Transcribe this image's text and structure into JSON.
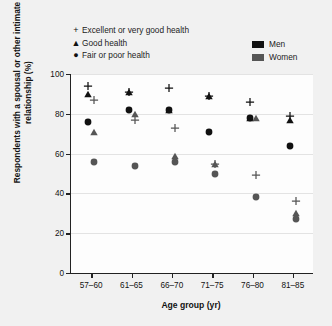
{
  "axes": {
    "ylabel": "Respondents with a spousal or other intimate relationship (%)",
    "xlabel": "Age group (yr)",
    "yticks": [
      "0",
      "20",
      "40",
      "60",
      "80",
      "100"
    ],
    "xticks": [
      "57–60",
      "61–65",
      "66–70",
      "71–75",
      "76–80",
      "81–85"
    ]
  },
  "legend": {
    "markers": [
      {
        "glyph": "+",
        "label": "Excellent or very good health"
      },
      {
        "glyph": "▲",
        "label": "Good health"
      },
      {
        "glyph": "●",
        "label": "Fair or poor health"
      }
    ],
    "series": [
      {
        "label": "Men",
        "color": "#111111"
      },
      {
        "label": "Women",
        "color": "#555555"
      }
    ]
  },
  "chart_data": {
    "type": "scatter",
    "title": "",
    "xlabel": "Age group (yr)",
    "ylabel": "Respondents with a spousal or other intimate relationship (%)",
    "ylim": [
      0,
      100
    ],
    "ytick_values": [
      0,
      20,
      40,
      60,
      80,
      100
    ],
    "grid": true,
    "legend_position": "top",
    "categories": [
      "57–60",
      "61–65",
      "66–70",
      "71–75",
      "76–80",
      "81–85"
    ],
    "marker_meaning": {
      "plus": "Excellent or very good health",
      "triangle": "Good health",
      "circle": "Fair or poor health"
    },
    "color_meaning": {
      "#111111": "Men",
      "#555555": "Women"
    },
    "series": [
      {
        "name": "Men – Excellent or very good health",
        "marker": "plus",
        "color": "#111111",
        "values": [
          94,
          91,
          93,
          89,
          86,
          79
        ]
      },
      {
        "name": "Men – Good health",
        "marker": "triangle",
        "color": "#111111",
        "values": [
          90,
          91,
          82,
          89,
          78,
          77
        ]
      },
      {
        "name": "Men – Fair or poor health",
        "marker": "circle",
        "color": "#111111",
        "values": [
          76,
          82,
          82,
          71,
          78,
          64
        ]
      },
      {
        "name": "Women – Excellent or very good health",
        "marker": "plus",
        "color": "#555555",
        "values": [
          87,
          77,
          73,
          55,
          49,
          36
        ]
      },
      {
        "name": "Women – Good health",
        "marker": "triangle",
        "color": "#555555",
        "values": [
          71,
          80,
          59,
          55,
          78,
          30
        ]
      },
      {
        "name": "Women – Fair or poor health",
        "marker": "circle",
        "color": "#555555",
        "values": [
          56,
          54,
          56,
          50,
          38,
          27
        ]
      }
    ],
    "points": [
      {
        "group": "57–60",
        "series": "Men",
        "health": "Excellent or very good health",
        "marker": "plus",
        "value": 94
      },
      {
        "group": "57–60",
        "series": "Men",
        "health": "Good health",
        "marker": "triangle",
        "value": 90
      },
      {
        "group": "57–60",
        "series": "Men",
        "health": "Fair or poor health",
        "marker": "circle",
        "value": 76
      },
      {
        "group": "57–60",
        "series": "Women",
        "health": "Excellent or very good health",
        "marker": "plus",
        "value": 87
      },
      {
        "group": "57–60",
        "series": "Women",
        "health": "Good health",
        "marker": "triangle",
        "value": 71
      },
      {
        "group": "57–60",
        "series": "Women",
        "health": "Fair or poor health",
        "marker": "circle",
        "value": 56
      },
      {
        "group": "61–65",
        "series": "Men",
        "health": "Excellent or very good health",
        "marker": "plus",
        "value": 91
      },
      {
        "group": "61–65",
        "series": "Men",
        "health": "Good health",
        "marker": "triangle",
        "value": 91
      },
      {
        "group": "61–65",
        "series": "Men",
        "health": "Fair or poor health",
        "marker": "circle",
        "value": 82
      },
      {
        "group": "61–65",
        "series": "Women",
        "health": "Excellent or very good health",
        "marker": "plus",
        "value": 77
      },
      {
        "group": "61–65",
        "series": "Women",
        "health": "Good health",
        "marker": "triangle",
        "value": 80
      },
      {
        "group": "61–65",
        "series": "Women",
        "health": "Fair or poor health",
        "marker": "circle",
        "value": 54
      },
      {
        "group": "66–70",
        "series": "Men",
        "health": "Excellent or very good health",
        "marker": "plus",
        "value": 93
      },
      {
        "group": "66–70",
        "series": "Men",
        "health": "Good health",
        "marker": "triangle",
        "value": 82
      },
      {
        "group": "66–70",
        "series": "Men",
        "health": "Fair or poor health",
        "marker": "circle",
        "value": 82
      },
      {
        "group": "66–70",
        "series": "Women",
        "health": "Excellent or very good health",
        "marker": "plus",
        "value": 73
      },
      {
        "group": "66–70",
        "series": "Women",
        "health": "Good health",
        "marker": "triangle",
        "value": 59
      },
      {
        "group": "66–70",
        "series": "Women",
        "health": "Fair or poor health",
        "marker": "circle",
        "value": 56
      },
      {
        "group": "71–75",
        "series": "Men",
        "health": "Excellent or very good health",
        "marker": "plus",
        "value": 89
      },
      {
        "group": "71–75",
        "series": "Men",
        "health": "Good health",
        "marker": "triangle",
        "value": 89
      },
      {
        "group": "71–75",
        "series": "Men",
        "health": "Fair or poor health",
        "marker": "circle",
        "value": 71
      },
      {
        "group": "71–75",
        "series": "Women",
        "health": "Excellent or very good health",
        "marker": "plus",
        "value": 55
      },
      {
        "group": "71–75",
        "series": "Women",
        "health": "Good health",
        "marker": "triangle",
        "value": 55
      },
      {
        "group": "71–75",
        "series": "Women",
        "health": "Fair or poor health",
        "marker": "circle",
        "value": 50
      },
      {
        "group": "76–80",
        "series": "Men",
        "health": "Excellent or very good health",
        "marker": "plus",
        "value": 86
      },
      {
        "group": "76–80",
        "series": "Men",
        "health": "Good health",
        "marker": "triangle",
        "value": 78
      },
      {
        "group": "76–80",
        "series": "Men",
        "health": "Fair or poor health",
        "marker": "circle",
        "value": 78
      },
      {
        "group": "76–80",
        "series": "Women",
        "health": "Excellent or very good health",
        "marker": "plus",
        "value": 49
      },
      {
        "group": "76–80",
        "series": "Women",
        "health": "Good health",
        "marker": "triangle",
        "value": 78
      },
      {
        "group": "76–80",
        "series": "Women",
        "health": "Fair or poor health",
        "marker": "circle",
        "value": 38
      },
      {
        "group": "81–85",
        "series": "Men",
        "health": "Excellent or very good health",
        "marker": "plus",
        "value": 79
      },
      {
        "group": "81–85",
        "series": "Men",
        "health": "Good health",
        "marker": "triangle",
        "value": 77
      },
      {
        "group": "81–85",
        "series": "Men",
        "health": "Fair or poor health",
        "marker": "circle",
        "value": 64
      },
      {
        "group": "81–85",
        "series": "Women",
        "health": "Excellent or very good health",
        "marker": "plus",
        "value": 36
      },
      {
        "group": "81–85",
        "series": "Women",
        "health": "Good health",
        "marker": "triangle",
        "value": 30
      },
      {
        "group": "81–85",
        "series": "Women",
        "health": "Fair or poor health",
        "marker": "circle",
        "value": 27
      }
    ]
  }
}
